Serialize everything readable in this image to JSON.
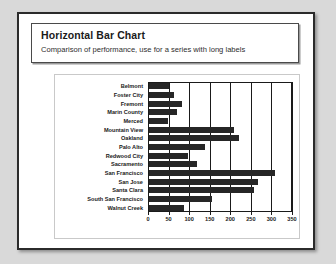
{
  "slide": {
    "title": "Horizontal Bar Chart",
    "subtitle": "Comparison of performance, use for a series with long labels"
  },
  "colors": {
    "bar": "#262626",
    "axis": "#1a1a1a",
    "slide_border": "#2b2b2b",
    "chart_border": "#c9c9c9",
    "page_background": "#d9d9d9"
  },
  "chart_data": {
    "type": "bar",
    "orientation": "horizontal",
    "title": "Horizontal Bar Chart",
    "subtitle": "Comparison of performance, use for a series with long labels",
    "xlabel": "",
    "ylabel": "",
    "xlim": [
      0,
      350
    ],
    "grid": true,
    "legend": "none",
    "categories": [
      "Belmont",
      "Foster City",
      "Fremont",
      "Marin County",
      "Merced",
      "Mountain View",
      "Oakland",
      "Palo Alto",
      "Redwood City",
      "Sacramento",
      "San Francisco",
      "San Jose",
      "Santa Clara",
      "South San Francisco",
      "Walnut Creek"
    ],
    "values": [
      50,
      62,
      82,
      70,
      48,
      208,
      222,
      138,
      98,
      118,
      308,
      268,
      258,
      155,
      88
    ],
    "xticks": [
      0,
      50,
      100,
      150,
      200,
      250,
      300,
      350
    ],
    "xtick_labels": [
      "0",
      "50",
      "100",
      "150",
      "200",
      "250",
      "300",
      "350"
    ]
  }
}
